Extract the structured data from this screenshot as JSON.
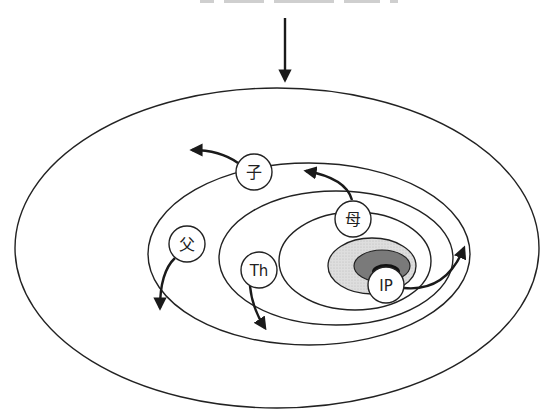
{
  "diagram": {
    "type": "concentric-ellipses-flow",
    "input_arrow": {
      "direction": "down",
      "label": ""
    },
    "rings": [
      {
        "id": "outer",
        "level": 1
      },
      {
        "id": "ring-2",
        "level": 2
      },
      {
        "id": "ring-3",
        "level": 3
      },
      {
        "id": "ring-4",
        "level": 4
      }
    ],
    "core": {
      "layers": [
        {
          "id": "light-shaded",
          "color": "#d6d6d6"
        },
        {
          "id": "dark-shaded",
          "color": "#7a7a7a"
        },
        {
          "id": "black-core",
          "color": "#111111"
        }
      ]
    },
    "nodes": [
      {
        "id": "child",
        "label": "子",
        "arrow": "out-left-up"
      },
      {
        "id": "mother",
        "label": "母",
        "arrow": "out-left-up"
      },
      {
        "id": "father",
        "label": "父",
        "arrow": "out-down"
      },
      {
        "id": "th",
        "label": "Th",
        "arrow": "out-down"
      },
      {
        "id": "ip",
        "label": "IP",
        "arrow": "out-right-up"
      }
    ],
    "colors": {
      "stroke": "#222222",
      "background": "#ffffff",
      "light_shade": "#d6d6d6",
      "dark_shade": "#7a7a7a",
      "core": "#111111"
    }
  }
}
